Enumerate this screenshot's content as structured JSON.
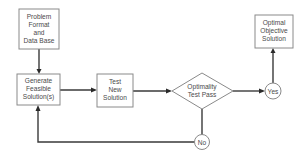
{
  "diagram": {
    "type": "flowchart",
    "nodes": {
      "problem_format": {
        "shape": "rectangle",
        "lines": [
          "Problem",
          "Format",
          "and",
          "Data Base"
        ]
      },
      "generate": {
        "shape": "rectangle",
        "lines": [
          "Generate",
          "Feasible",
          "Solution(s)"
        ]
      },
      "test_new": {
        "shape": "rectangle",
        "lines": [
          "Test",
          "New",
          "Solution"
        ]
      },
      "optimality": {
        "shape": "diamond",
        "lines": [
          "Optimality",
          "Test Pass"
        ]
      },
      "yes": {
        "shape": "circle",
        "label": "Yes"
      },
      "no": {
        "shape": "circle",
        "label": "No"
      },
      "optimal": {
        "shape": "rectangle",
        "lines": [
          "Optimal",
          "Objective",
          "Solution"
        ]
      }
    },
    "edges": [
      {
        "from": "problem_format",
        "to": "generate"
      },
      {
        "from": "generate",
        "to": "test_new"
      },
      {
        "from": "test_new",
        "to": "optimality"
      },
      {
        "from": "optimality",
        "to": "yes"
      },
      {
        "from": "yes",
        "to": "optimal"
      },
      {
        "from": "optimality",
        "to": "no"
      },
      {
        "from": "no",
        "to": "generate"
      }
    ],
    "colors": {
      "stroke": "#8a8a8a",
      "line": "#3a3a3a",
      "text": "#4a4a4a",
      "background": "#ffffff"
    }
  }
}
